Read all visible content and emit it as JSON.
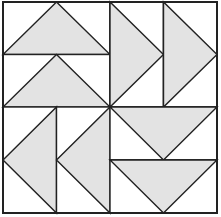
{
  "diagram": {
    "title": "",
    "colors": {
      "background": "#ffffff",
      "triangle_fill": "#e3e3e3",
      "line": "#222222"
    },
    "bounds": {
      "x0": 3,
      "y0": 2,
      "x1": 217,
      "y1": 213,
      "cx": 110,
      "cy": 107
    },
    "quadrants": [
      {
        "name": "top-left",
        "orientation": "up",
        "units": 2,
        "split": "horizontal"
      },
      {
        "name": "top-right",
        "orientation": "right",
        "units": 2,
        "split": "vertical"
      },
      {
        "name": "bottom-left",
        "orientation": "left",
        "units": 2,
        "split": "vertical"
      },
      {
        "name": "bottom-right",
        "orientation": "down",
        "units": 2,
        "split": "horizontal"
      }
    ]
  }
}
